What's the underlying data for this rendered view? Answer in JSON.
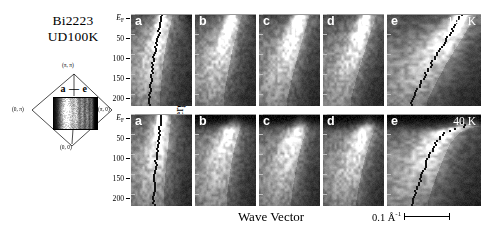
{
  "caption": {
    "material": "Bi2223",
    "doping": "UD100K"
  },
  "bz_diagram": {
    "name": "brillouin-zone",
    "cut_label": "a — e",
    "corner_labels": [
      {
        "text": "(π, π)",
        "pos": "top"
      },
      {
        "text": "(0, π)",
        "pos": "left"
      },
      {
        "text": "(π, 0)",
        "pos": "right"
      },
      {
        "text": "(0, 0)",
        "pos": "bottom"
      }
    ]
  },
  "axes": {
    "y_title": "Binding Energy(eV)",
    "x_title": "Wave Vector",
    "y_ticks": [
      "EF",
      "50",
      "100",
      "150",
      "200"
    ],
    "y_tick_values": [
      0,
      50,
      100,
      150,
      200
    ],
    "y_unit_note": "meV",
    "scalebar_label": "0.1 Å",
    "scalebar_exponent": "-1"
  },
  "rows": [
    {
      "name": "row-140K",
      "temperature": "140 K",
      "panels": [
        {
          "label": "a",
          "width": "small"
        },
        {
          "label": "b",
          "width": "small"
        },
        {
          "label": "c",
          "width": "small"
        },
        {
          "label": "d",
          "width": "small"
        },
        {
          "label": "e",
          "width": "wide"
        }
      ]
    },
    {
      "name": "row-40K",
      "temperature": "40 K",
      "panels": [
        {
          "label": "a",
          "width": "small"
        },
        {
          "label": "b",
          "width": "small"
        },
        {
          "label": "c",
          "width": "small"
        },
        {
          "label": "d",
          "width": "small"
        },
        {
          "label": "e",
          "width": "wide"
        }
      ]
    }
  ],
  "chart_data": {
    "type": "heatmap",
    "xlabel": "Wave Vector",
    "ylabel": "Binding Energy(eV)",
    "ylim": [
      0,
      230
    ],
    "y_tick_labels": [
      "EF",
      "50",
      "100",
      "150",
      "200"
    ],
    "y_tick_values": [
      0,
      50,
      100,
      150,
      200
    ],
    "y_axis_direction": "increasing downward",
    "colormap": "grayscale (black = low intensity, white = high intensity)",
    "scalebar": {
      "label": "0.1 Å-1",
      "length_px": 46
    },
    "grid": false,
    "legend": "none",
    "panels": [
      {
        "row": "140 K",
        "label": "a",
        "cut": "nodal",
        "band_kink_meV": 70,
        "dispersion": [
          {
            "E": 0,
            "k": 0.52
          },
          {
            "E": 20,
            "k": 0.5
          },
          {
            "E": 40,
            "k": 0.47
          },
          {
            "E": 60,
            "k": 0.44
          },
          {
            "E": 80,
            "k": 0.41
          },
          {
            "E": 100,
            "k": 0.39
          },
          {
            "E": 120,
            "k": 0.37
          },
          {
            "E": 150,
            "k": 0.35
          },
          {
            "E": 180,
            "k": 0.33
          },
          {
            "E": 210,
            "k": 0.31
          }
        ]
      },
      {
        "row": "140 K",
        "label": "b",
        "cut": "off-nodal-1",
        "dispersion": [
          {
            "E": 0,
            "k": 0.62
          },
          {
            "E": 20,
            "k": 0.58
          },
          {
            "E": 40,
            "k": 0.54
          },
          {
            "E": 70,
            "k": 0.49
          },
          {
            "E": 100,
            "k": 0.44
          },
          {
            "E": 140,
            "k": 0.39
          },
          {
            "E": 180,
            "k": 0.34
          },
          {
            "E": 210,
            "k": 0.31
          }
        ]
      },
      {
        "row": "140 K",
        "label": "c",
        "cut": "off-nodal-2",
        "dispersion": [
          {
            "E": 0,
            "k": 0.68
          },
          {
            "E": 25,
            "k": 0.63
          },
          {
            "E": 50,
            "k": 0.58
          },
          {
            "E": 80,
            "k": 0.52
          },
          {
            "E": 120,
            "k": 0.45
          },
          {
            "E": 160,
            "k": 0.38
          },
          {
            "E": 200,
            "k": 0.32
          },
          {
            "E": 215,
            "k": 0.3
          }
        ]
      },
      {
        "row": "140 K",
        "label": "d",
        "cut": "off-nodal-3",
        "dispersion": [
          {
            "E": 0,
            "k": 0.72
          },
          {
            "E": 25,
            "k": 0.67
          },
          {
            "E": 55,
            "k": 0.6
          },
          {
            "E": 90,
            "k": 0.53
          },
          {
            "E": 130,
            "k": 0.45
          },
          {
            "E": 170,
            "k": 0.37
          },
          {
            "E": 210,
            "k": 0.3
          }
        ]
      },
      {
        "row": "140 K",
        "label": "e",
        "cut": "antinodal",
        "has_extracted_dispersion_markers": true,
        "dispersion": [
          {
            "E": 0,
            "k": 0.8
          },
          {
            "E": 30,
            "k": 0.72
          },
          {
            "E": 60,
            "k": 0.64
          },
          {
            "E": 90,
            "k": 0.56
          },
          {
            "E": 120,
            "k": 0.48
          },
          {
            "E": 150,
            "k": 0.41
          },
          {
            "E": 180,
            "k": 0.34
          },
          {
            "E": 215,
            "k": 0.27
          }
        ]
      },
      {
        "row": "40 K",
        "label": "a",
        "cut": "nodal",
        "dispersion": [
          {
            "E": 0,
            "k": 0.5
          },
          {
            "E": 25,
            "k": 0.49
          },
          {
            "E": 50,
            "k": 0.47
          },
          {
            "E": 80,
            "k": 0.45
          },
          {
            "E": 120,
            "k": 0.42
          },
          {
            "E": 160,
            "k": 0.4
          },
          {
            "E": 200,
            "k": 0.38
          }
        ]
      },
      {
        "row": "40 K",
        "label": "b",
        "cut": "off-nodal-1",
        "gap_backbend": true,
        "dispersion": [
          {
            "E": 15,
            "k": 0.66
          },
          {
            "E": 30,
            "k": 0.6
          },
          {
            "E": 55,
            "k": 0.54
          },
          {
            "E": 90,
            "k": 0.48
          },
          {
            "E": 130,
            "k": 0.43
          },
          {
            "E": 175,
            "k": 0.39
          },
          {
            "E": 210,
            "k": 0.36
          }
        ]
      },
      {
        "row": "40 K",
        "label": "c",
        "cut": "off-nodal-2",
        "gap_backbend": true,
        "dispersion": [
          {
            "E": 20,
            "k": 0.68
          },
          {
            "E": 40,
            "k": 0.62
          },
          {
            "E": 70,
            "k": 0.55
          },
          {
            "E": 105,
            "k": 0.49
          },
          {
            "E": 145,
            "k": 0.44
          },
          {
            "E": 190,
            "k": 0.39
          },
          {
            "E": 215,
            "k": 0.37
          }
        ]
      },
      {
        "row": "40 K",
        "label": "d",
        "cut": "off-nodal-3",
        "gap_backbend": true,
        "dispersion": [
          {
            "E": 22,
            "k": 0.74
          },
          {
            "E": 45,
            "k": 0.67
          },
          {
            "E": 75,
            "k": 0.6
          },
          {
            "E": 110,
            "k": 0.53
          },
          {
            "E": 150,
            "k": 0.47
          },
          {
            "E": 195,
            "k": 0.41
          },
          {
            "E": 215,
            "k": 0.39
          }
        ]
      },
      {
        "row": "40 K",
        "label": "e",
        "cut": "antinodal",
        "gap_backbend": true,
        "has_extracted_dispersion_markers": true,
        "dispersion": [
          {
            "E": 30,
            "k": 0.82
          },
          {
            "E": 35,
            "k": 0.72
          },
          {
            "E": 45,
            "k": 0.62
          },
          {
            "E": 70,
            "k": 0.52
          },
          {
            "E": 105,
            "k": 0.45
          },
          {
            "E": 145,
            "k": 0.38
          },
          {
            "E": 185,
            "k": 0.32
          },
          {
            "E": 215,
            "k": 0.28
          }
        ]
      }
    ]
  }
}
